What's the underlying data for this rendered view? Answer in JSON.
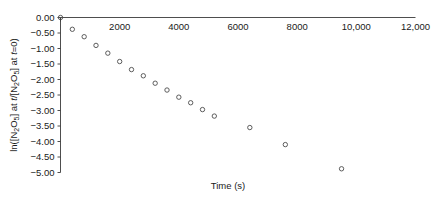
{
  "chart_data": {
    "type": "scatter",
    "title": "",
    "xlabel": "Time (s)",
    "ylabel": "ln([N2O5] at t/[N2O5] at t=0)",
    "ylabel_parts": {
      "prefix": "ln([N",
      "sub1": "2",
      "mid1": "O",
      "sub2": "5",
      "mid2": "] at ",
      "ital1": "t",
      "mid3": "/[N",
      "sub3": "2",
      "mid4": "O",
      "sub4": "5",
      "mid5": "] at ",
      "ital2": "t",
      "suffix": "=0)"
    },
    "xlim": [
      0,
      12000
    ],
    "ylim": [
      -5.0,
      0.0
    ],
    "xticks": [
      0,
      2000,
      4000,
      6000,
      8000,
      10000,
      12000
    ],
    "xticklabels": [
      "",
      "2000",
      "4000",
      "6000",
      "8000",
      "10,000",
      "12,000"
    ],
    "yticks": [
      0.0,
      -0.5,
      -1.0,
      -1.5,
      -2.0,
      -2.5,
      -3.0,
      -3.5,
      -4.0,
      -4.5,
      -5.0
    ],
    "yticklabels": [
      "0.00",
      "-0.50",
      "-1.00",
      "-1.50",
      "-2.00",
      "-2.50",
      "-3.00",
      "-3.50",
      "-4.00",
      "-4.50",
      "-5.00"
    ],
    "grid": false,
    "legend": false,
    "x_axis_position": "top",
    "marker": "open-circle",
    "marker_color": "#4c4c4c",
    "axis_color": "#3a3a3a",
    "x": [
      0,
      400,
      800,
      1200,
      1600,
      2000,
      2400,
      2800,
      3200,
      3600,
      4000,
      4400,
      4800,
      5200,
      6400,
      7600,
      9500
    ],
    "y": [
      0.0,
      -0.38,
      -0.62,
      -0.9,
      -1.15,
      -1.42,
      -1.68,
      -1.88,
      -2.12,
      -2.34,
      -2.57,
      -2.75,
      -2.97,
      -3.18,
      -3.55,
      -4.1,
      -4.88
    ],
    "points": [
      {
        "x": 0,
        "y": 0.0
      },
      {
        "x": 400,
        "y": -0.38
      },
      {
        "x": 800,
        "y": -0.62
      },
      {
        "x": 1200,
        "y": -0.9
      },
      {
        "x": 1600,
        "y": -1.15
      },
      {
        "x": 2000,
        "y": -1.42
      },
      {
        "x": 2400,
        "y": -1.68
      },
      {
        "x": 2800,
        "y": -1.88
      },
      {
        "x": 3200,
        "y": -2.12
      },
      {
        "x": 3600,
        "y": -2.34
      },
      {
        "x": 4000,
        "y": -2.57
      },
      {
        "x": 4400,
        "y": -2.75
      },
      {
        "x": 4800,
        "y": -2.97
      },
      {
        "x": 5200,
        "y": -3.18
      },
      {
        "x": 6400,
        "y": -3.55
      },
      {
        "x": 7600,
        "y": -4.1
      },
      {
        "x": 9500,
        "y": -4.88
      }
    ]
  }
}
